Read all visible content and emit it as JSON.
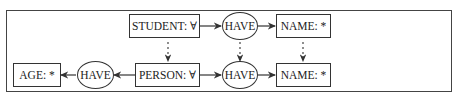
{
  "diagram": {
    "type": "conceptual-graph",
    "nodes": {
      "student": {
        "label": "STUDENT: ∀",
        "shape": "rect"
      },
      "have_top": {
        "label": "HAVE",
        "shape": "ellipse"
      },
      "name_top": {
        "label": "NAME: *",
        "shape": "rect"
      },
      "age": {
        "label": "AGE: *",
        "shape": "rect"
      },
      "have_left": {
        "label": "HAVE",
        "shape": "ellipse"
      },
      "person": {
        "label": "PERSON: ∀",
        "shape": "rect"
      },
      "have_bottom": {
        "label": "HAVE",
        "shape": "ellipse"
      },
      "name_bottom": {
        "label": "NAME: *",
        "shape": "rect"
      }
    },
    "edges": [
      {
        "from": "student",
        "to": "have_top",
        "style": "solid"
      },
      {
        "from": "have_top",
        "to": "name_top",
        "style": "solid"
      },
      {
        "from": "person",
        "to": "have_left",
        "style": "solid"
      },
      {
        "from": "have_left",
        "to": "age",
        "style": "solid"
      },
      {
        "from": "person",
        "to": "have_bottom",
        "style": "solid"
      },
      {
        "from": "have_bottom",
        "to": "name_bottom",
        "style": "solid"
      },
      {
        "from": "student",
        "to": "person",
        "style": "dashed"
      },
      {
        "from": "have_top",
        "to": "have_bottom",
        "style": "dashed"
      },
      {
        "from": "name_top",
        "to": "name_bottom",
        "style": "dashed"
      }
    ]
  }
}
